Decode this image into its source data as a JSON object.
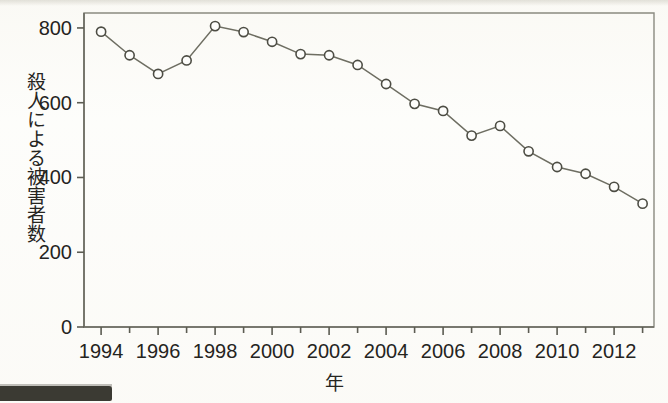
{
  "chart_data": {
    "type": "line",
    "title": "",
    "subtitle": "",
    "xlabel": "年",
    "ylabel": "殺人による被害者数",
    "x": [
      1994,
      1995,
      1996,
      1997,
      1998,
      1999,
      2000,
      2001,
      2002,
      2003,
      2004,
      2005,
      2006,
      2007,
      2008,
      2009,
      2010,
      2011,
      2012,
      2013
    ],
    "values": [
      790,
      727,
      677,
      713,
      805,
      789,
      763,
      730,
      727,
      701,
      650,
      597,
      578,
      512,
      538,
      470,
      428,
      410,
      375,
      330
    ],
    "series": [
      {
        "name": "殺人による被害者数",
        "values": [
          790,
          727,
          677,
          713,
          805,
          789,
          763,
          730,
          727,
          701,
          650,
          597,
          578,
          512,
          538,
          470,
          428,
          410,
          375,
          330
        ]
      }
    ],
    "xlim": [
      1993.4,
      2013.4
    ],
    "ylim": [
      0,
      840
    ],
    "xticks": [
      1994,
      1996,
      1998,
      2000,
      2002,
      2004,
      2006,
      2008,
      2010,
      2012
    ],
    "xtick_labels": [
      "1994",
      "1996",
      "1998",
      "2000",
      "2002",
      "2004",
      "2006",
      "2008",
      "2010",
      "2012"
    ],
    "xticks_minor": [
      1995,
      1997,
      1999,
      2001,
      2003,
      2005,
      2007,
      2009,
      2011,
      2013
    ],
    "yticks": [
      0,
      200,
      400,
      600,
      800
    ],
    "ytick_labels": [
      "0",
      "200",
      "400",
      "600",
      "800"
    ],
    "grid": false,
    "legend": false,
    "legend_position": "none",
    "marker": "open-circle",
    "line_color": "#6e6e62",
    "marker_fill": "#fdfdfb",
    "marker_edge": "#4d4d44",
    "background_color": "#fdfdfb",
    "axis_color": "#5c5c52"
  },
  "figure": {
    "axis_label_y": "殺人による被害者数",
    "axis_label_x": "年"
  }
}
